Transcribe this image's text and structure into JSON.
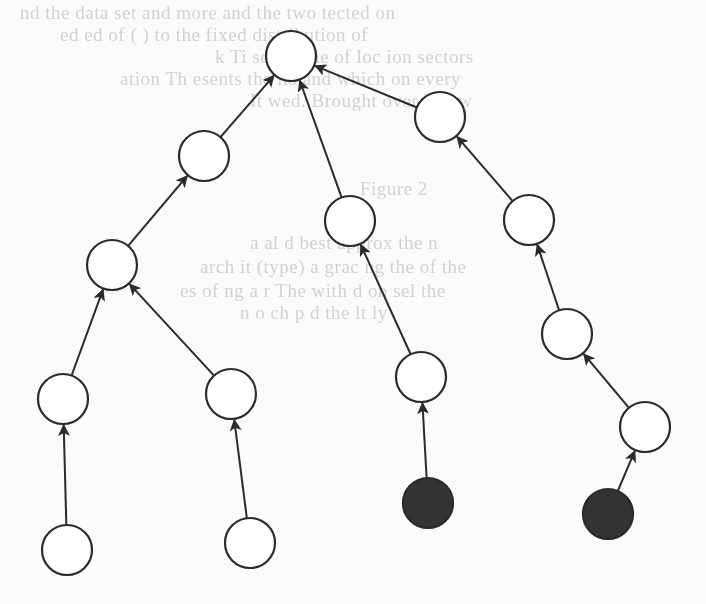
{
  "background_text": {
    "lines": [
      {
        "text": "nd the data set  and more   and   the two  tected on",
        "x": 20,
        "y": 2
      },
      {
        "text": "ed  ed   of  (   ) to  the  fixed  distribution of",
        "x": 60,
        "y": 24
      },
      {
        "text": "k  Ti   se the     the  of  loc ion sectors",
        "x": 215,
        "y": 46
      },
      {
        "text": "ation  Th  esents the  ho  and  which on every",
        "x": 120,
        "y": 68
      },
      {
        "text": "It     wed.  Brought  over  below",
        "x": 250,
        "y": 90
      },
      {
        "text": "Figure 2",
        "x": 360,
        "y": 178
      },
      {
        "text": "a   al  d  best  approx  the  n",
        "x": 250,
        "y": 232
      },
      {
        "text": "arch  it (type)     a  grac  ng  the  of the",
        "x": 200,
        "y": 256
      },
      {
        "text": "  es  of  ng  a  r  The  with  d  on  sel  the",
        "x": 180,
        "y": 280
      },
      {
        "text": "   n  o   ch  p     d  the   lt  ly",
        "x": 240,
        "y": 302
      }
    ]
  },
  "diagram": {
    "node_radius": 25,
    "colors": {
      "stroke": "#2a2a2a",
      "open_fill": "#ffffff",
      "filled_fill": "#333333"
    },
    "nodes": [
      {
        "id": "root",
        "x": 291,
        "y": 56,
        "filled": false
      },
      {
        "id": "a",
        "x": 204,
        "y": 156,
        "filled": false
      },
      {
        "id": "b",
        "x": 112,
        "y": 265,
        "filled": false
      },
      {
        "id": "c",
        "x": 350,
        "y": 221,
        "filled": false
      },
      {
        "id": "d",
        "x": 440,
        "y": 117,
        "filled": false
      },
      {
        "id": "e",
        "x": 529,
        "y": 220,
        "filled": false
      },
      {
        "id": "f",
        "x": 567,
        "y": 334,
        "filled": false
      },
      {
        "id": "g",
        "x": 63,
        "y": 399,
        "filled": false
      },
      {
        "id": "h",
        "x": 231,
        "y": 394,
        "filled": false
      },
      {
        "id": "i",
        "x": 67,
        "y": 550,
        "filled": false
      },
      {
        "id": "j",
        "x": 250,
        "y": 543,
        "filled": false
      },
      {
        "id": "k",
        "x": 421,
        "y": 377,
        "filled": false
      },
      {
        "id": "l",
        "x": 428,
        "y": 503,
        "filled": true
      },
      {
        "id": "m",
        "x": 645,
        "y": 427,
        "filled": false
      },
      {
        "id": "n",
        "x": 608,
        "y": 514,
        "filled": true
      }
    ],
    "edges": [
      {
        "from": "a",
        "to": "root"
      },
      {
        "from": "c",
        "to": "root"
      },
      {
        "from": "d",
        "to": "root"
      },
      {
        "from": "b",
        "to": "a"
      },
      {
        "from": "g",
        "to": "b"
      },
      {
        "from": "h",
        "to": "b"
      },
      {
        "from": "i",
        "to": "g"
      },
      {
        "from": "j",
        "to": "h"
      },
      {
        "from": "k",
        "to": "c"
      },
      {
        "from": "l",
        "to": "k"
      },
      {
        "from": "e",
        "to": "d"
      },
      {
        "from": "f",
        "to": "e"
      },
      {
        "from": "m",
        "to": "f"
      },
      {
        "from": "n",
        "to": "m"
      }
    ]
  }
}
